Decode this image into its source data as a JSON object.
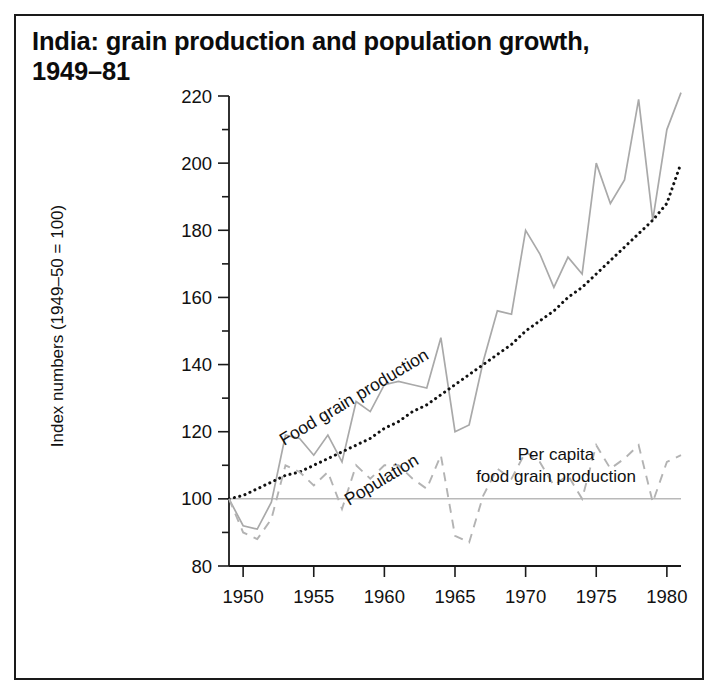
{
  "figure": {
    "title_line1": "India: grain production and population growth,",
    "title_line2": "1949–81"
  },
  "chart_data": {
    "type": "line",
    "title": "India: grain production and population growth, 1949–81",
    "xlabel": "",
    "ylabel": "Index numbers (1949–50 = 100)",
    "xlim": [
      1949,
      1981
    ],
    "ylim": [
      80,
      220
    ],
    "ytick_major": [
      80,
      100,
      120,
      140,
      160,
      180,
      200,
      220
    ],
    "ytick_minor": [
      90,
      110,
      130,
      150,
      170,
      190,
      210
    ],
    "xticks": [
      1950,
      1955,
      1960,
      1965,
      1970,
      1975,
      1980
    ],
    "xtick_labels": [
      "1950",
      "1955",
      "1960",
      "1965",
      "1970",
      "1975",
      "1980"
    ],
    "grid": false,
    "legend": "inline-labels",
    "reference_line": {
      "value": 100,
      "color": "#b9b9b9"
    },
    "x": [
      1949,
      1950,
      1951,
      1952,
      1953,
      1954,
      1955,
      1956,
      1957,
      1958,
      1959,
      1960,
      1961,
      1962,
      1963,
      1964,
      1965,
      1966,
      1967,
      1968,
      1969,
      1970,
      1971,
      1972,
      1973,
      1974,
      1975,
      1976,
      1977,
      1978,
      1979,
      1980,
      1981
    ],
    "series": [
      {
        "name": "Food grain production",
        "style": "solid",
        "color": "#a9a9a9",
        "values": [
          100,
          92,
          91,
          99,
          119,
          118,
          113,
          119,
          111,
          129,
          126,
          134,
          135,
          134,
          133,
          148,
          120,
          122,
          141,
          156,
          155,
          180,
          173,
          163,
          172,
          167,
          200,
          188,
          195,
          219,
          183,
          210,
          221
        ]
      },
      {
        "name": "Population",
        "style": "dotted",
        "color": "#111111",
        "values": [
          100,
          101,
          103,
          105,
          107,
          108,
          110,
          112,
          114,
          116,
          118,
          121,
          123,
          126,
          128,
          131,
          134,
          137,
          140,
          143,
          146,
          150,
          153,
          156,
          160,
          163,
          167,
          171,
          175,
          179,
          183,
          188,
          200
        ]
      },
      {
        "name": "Per capita food grain production",
        "style": "dashed",
        "color": "#b3b3b3",
        "values": [
          100,
          90,
          88,
          94,
          110,
          108,
          104,
          108,
          97,
          110,
          106,
          110,
          110,
          106,
          103,
          113,
          89,
          87,
          101,
          109,
          106,
          114,
          111,
          104,
          107,
          100,
          116,
          109,
          112,
          116,
          99,
          111,
          113
        ]
      }
    ],
    "annotations": [
      {
        "name": "food-grain-production-label",
        "text": "Food grain production",
        "rotation": -31
      },
      {
        "name": "population-label",
        "text": "Population",
        "rotation": -31
      },
      {
        "name": "per-capita-label-line1",
        "text": "Per capita"
      },
      {
        "name": "per-capita-label-line2",
        "text": "food grain production"
      }
    ]
  }
}
